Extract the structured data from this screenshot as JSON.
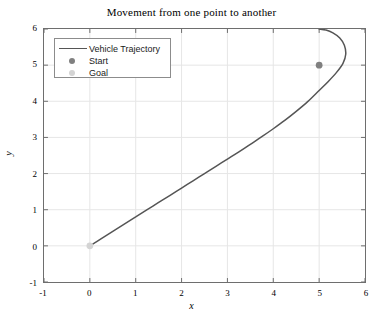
{
  "chart_data": {
    "type": "line",
    "title": "Movement from one point to another",
    "xlabel": "x",
    "ylabel": "y",
    "xlim": [
      -1,
      6
    ],
    "ylim": [
      -1,
      6
    ],
    "xticks": [
      "-1",
      "0",
      "1",
      "2",
      "3",
      "4",
      "5",
      "6"
    ],
    "yticks": [
      "-1",
      "0",
      "1",
      "2",
      "3",
      "4",
      "5",
      "6"
    ],
    "xtick_values": [
      -1,
      0,
      1,
      2,
      3,
      4,
      5,
      6
    ],
    "ytick_values": [
      -1,
      0,
      1,
      2,
      3,
      4,
      5,
      6
    ],
    "grid": true,
    "legend_position": "upper left",
    "series": [
      {
        "name": "Vehicle Trajectory",
        "type": "line",
        "color": "#555555",
        "points": [
          [
            0.0,
            0.0
          ],
          [
            0.25,
            0.2
          ],
          [
            0.5,
            0.4
          ],
          [
            0.75,
            0.6
          ],
          [
            1.0,
            0.8
          ],
          [
            1.25,
            1.0
          ],
          [
            1.5,
            1.2
          ],
          [
            1.75,
            1.4
          ],
          [
            2.0,
            1.6
          ],
          [
            2.25,
            1.8
          ],
          [
            2.5,
            2.0
          ],
          [
            2.75,
            2.2
          ],
          [
            3.0,
            2.4
          ],
          [
            3.25,
            2.6
          ],
          [
            3.5,
            2.81
          ],
          [
            3.75,
            3.02
          ],
          [
            4.0,
            3.24
          ],
          [
            4.25,
            3.47
          ],
          [
            4.5,
            3.72
          ],
          [
            4.75,
            3.99
          ],
          [
            5.0,
            4.3
          ],
          [
            5.2,
            4.55
          ],
          [
            5.38,
            4.8
          ],
          [
            5.52,
            5.05
          ],
          [
            5.58,
            5.3
          ],
          [
            5.55,
            5.55
          ],
          [
            5.45,
            5.75
          ],
          [
            5.3,
            5.89
          ],
          [
            5.15,
            5.97
          ],
          [
            5.0,
            6.0
          ]
        ]
      },
      {
        "name": "Start",
        "type": "marker",
        "color": "#808080",
        "points": [
          [
            5.0,
            5.0
          ]
        ]
      },
      {
        "name": "Goal",
        "type": "marker",
        "color": "#d4d4d4",
        "points": [
          [
            0.0,
            0.0
          ]
        ]
      }
    ]
  },
  "legend": {
    "entries": [
      {
        "label": "Vehicle Trajectory",
        "symbol": "line",
        "color": "#555555"
      },
      {
        "label": "Start",
        "symbol": "dot",
        "color": "#808080"
      },
      {
        "label": "Goal",
        "symbol": "dot",
        "color": "#d4d4d4"
      }
    ]
  },
  "axes": {
    "grid_color": "#e6e6e6",
    "axis_color": "#6e6e6e"
  }
}
